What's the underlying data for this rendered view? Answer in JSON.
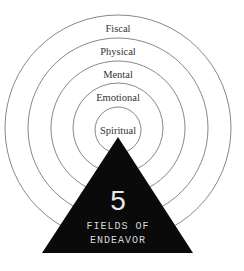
{
  "diagram": {
    "title_number": "5",
    "title_line1": "FIELDS OF",
    "title_line2": "ENDEAVOR",
    "rings": [
      {
        "label": "Fiscal"
      },
      {
        "label": "Physical"
      },
      {
        "label": "Mental"
      },
      {
        "label": "Emotional"
      },
      {
        "label": "Spiritual"
      }
    ],
    "colors": {
      "ring_stroke": "#7a7a7a",
      "triangle_fill": "#0a0a0a",
      "text_on_triangle": "#e8e8e8"
    }
  }
}
